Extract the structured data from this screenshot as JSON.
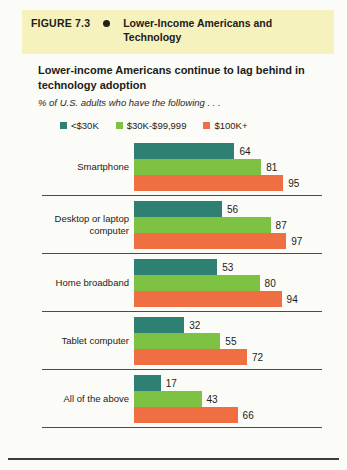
{
  "banner": {
    "figure_label": "FIGURE 7.3",
    "bullet": "bullet-icon",
    "title": "Lower-Income Americans and Technology",
    "background_color": "#f6f2bd"
  },
  "subtitle": "Lower-income Americans continue to lag behind in technology adoption",
  "tagline": "% of U.S. adults who have the following . . .",
  "chart_data": {
    "type": "bar",
    "orientation": "horizontal",
    "title": "Lower-income Americans continue to lag behind in technology adoption",
    "subtitle": "% of U.S. adults who have the following . . .",
    "xlabel": "",
    "ylabel": "",
    "xlim": [
      0,
      100
    ],
    "grid": false,
    "legend_position": "top",
    "categories": [
      "Smartphone",
      "Desktop or laptop computer",
      "Home broadband",
      "Tablet computer",
      "All of the above"
    ],
    "series": [
      {
        "name": "<$30K",
        "color": "#2e8073",
        "values": [
          64,
          56,
          53,
          32,
          17
        ]
      },
      {
        "name": "$30K-$99,999",
        "color": "#7dc242",
        "values": [
          81,
          87,
          80,
          55,
          43
        ]
      },
      {
        "name": "$100K+",
        "color": "#ef6f42",
        "values": [
          95,
          97,
          94,
          72,
          66
        ]
      }
    ]
  }
}
